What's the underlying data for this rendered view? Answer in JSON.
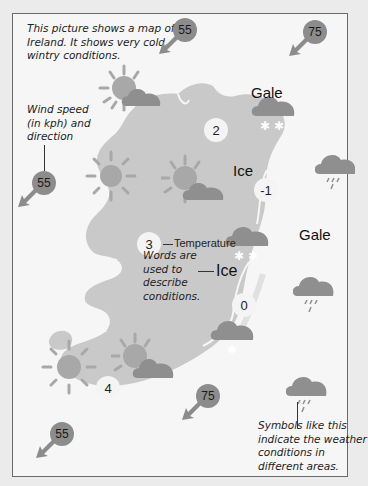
{
  "intro_text": [
    "This picture shows a map of",
    "Ireland. It shows very cold,",
    "wintry conditions."
  ],
  "wind_note": [
    "Wind speed",
    "(in kph) and",
    "direction"
  ],
  "temperature_note": "Temperature",
  "words_note": [
    "Words are",
    "used to",
    "describe",
    "conditions."
  ],
  "symbols_note": [
    "Symbols like this",
    "indicate the weather",
    "conditions in",
    "different areas."
  ],
  "condition_labels": {
    "gale_north": "Gale",
    "gale_east": "Gale",
    "ice_center": "Ice",
    "ice_example": "Ice"
  },
  "temperatures": {
    "north": "2",
    "northeast": "-1",
    "west": "3",
    "east": "0",
    "south": "4"
  },
  "wind_speeds": {
    "top_center": "55",
    "top_right": "75",
    "left": "55",
    "bottom_center": "75",
    "bottom_left": "55"
  },
  "colors": {
    "land": "#c9c9c9",
    "sea": "#f6f6f6",
    "cloud": "#8f8f8f",
    "sun": "#a8a8a8",
    "wind_marker": "#8c8c8c",
    "temperature_circle": "#f4f4f4"
  }
}
